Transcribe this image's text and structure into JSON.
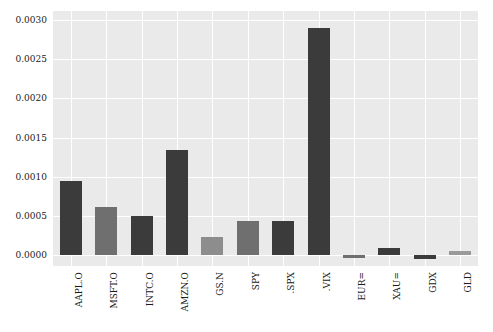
{
  "chart_data": {
    "type": "bar",
    "title": "",
    "xlabel": "",
    "ylabel": "",
    "categories": [
      "AAPL.O",
      "MSFT.O",
      "INTC.O",
      "AMZN.O",
      "GS.N",
      "SPY",
      ".SPX",
      ".VIX",
      "EUR=",
      "XAU=",
      "GDX",
      "GLD"
    ],
    "values": [
      0.00094,
      0.00061,
      0.0005,
      0.00134,
      0.00022,
      0.00043,
      0.00043,
      0.0029,
      -4e-05,
      8e-05,
      -5e-05,
      5e-05
    ],
    "bar_colors": [
      "#3b3b3b",
      "#6f6f6f",
      "#3b3b3b",
      "#3b3b3b",
      "#8d8d8d",
      "#6f6f6f",
      "#3b3b3b",
      "#3b3b3b",
      "#6f6f6f",
      "#3b3b3b",
      "#3b3b3b",
      "#9a9a9a"
    ],
    "ylim": [
      -0.000145,
      0.00312
    ],
    "yticks": [
      0.0,
      0.0005,
      0.001,
      0.0015,
      0.002,
      0.0025,
      0.003
    ],
    "ytick_labels": [
      "0.0000",
      "0.0005",
      "0.0010",
      "0.0015",
      "0.0020",
      "0.0025",
      "0.0030"
    ],
    "grid": true,
    "grid_color": "#ffffff",
    "plot_background": "#eaeaea",
    "figure_background": "#ffffff",
    "legend": null,
    "legend_position": "none"
  }
}
